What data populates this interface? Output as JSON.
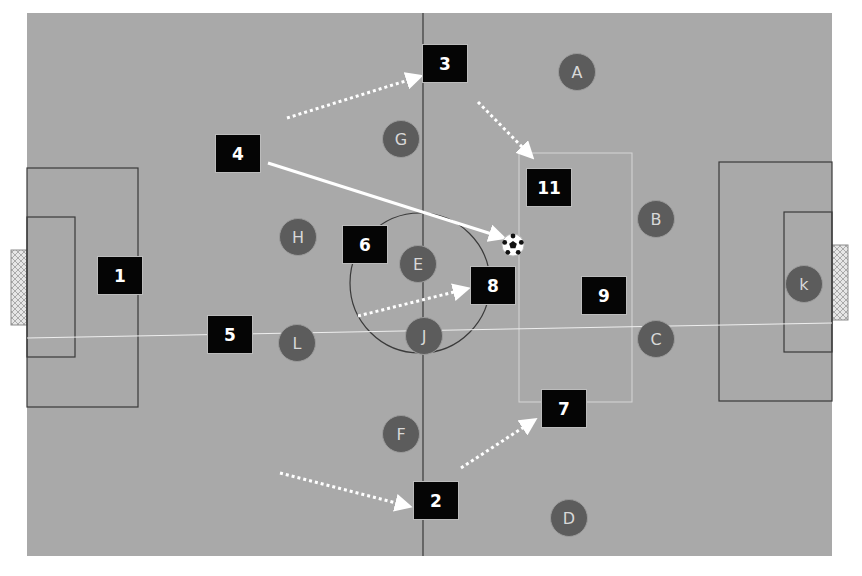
{
  "diagram": {
    "type": "football-tactics-board",
    "colors": {
      "page_background": "#ffffff",
      "pitch": "#a9a9a9",
      "pitch_lines": "#3a3a3a",
      "team_box": "#050505",
      "team_text": "#ffffff",
      "opponent_circle": "#5c5c5c",
      "opponent_text": "#d8d8d8",
      "arrow": "#ffffff"
    },
    "team_players": [
      {
        "label": "1",
        "x": 97,
        "y": 256
      },
      {
        "label": "2",
        "x": 413,
        "y": 481
      },
      {
        "label": "3",
        "x": 422,
        "y": 44
      },
      {
        "label": "4",
        "x": 215,
        "y": 134
      },
      {
        "label": "5",
        "x": 207,
        "y": 315
      },
      {
        "label": "6",
        "x": 342,
        "y": 225
      },
      {
        "label": "7",
        "x": 541,
        "y": 389
      },
      {
        "label": "8",
        "x": 470,
        "y": 266
      },
      {
        "label": "9",
        "x": 581,
        "y": 276
      },
      {
        "label": "11",
        "x": 526,
        "y": 168
      }
    ],
    "opponents": [
      {
        "label": "A",
        "x": 558,
        "y": 53
      },
      {
        "label": "B",
        "x": 637,
        "y": 200
      },
      {
        "label": "C",
        "x": 637,
        "y": 320
      },
      {
        "label": "D",
        "x": 550,
        "y": 499
      },
      {
        "label": "E",
        "x": 399,
        "y": 245
      },
      {
        "label": "F",
        "x": 382,
        "y": 415
      },
      {
        "label": "G",
        "x": 382,
        "y": 120
      },
      {
        "label": "H",
        "x": 279,
        "y": 218
      },
      {
        "label": "J",
        "x": 405,
        "y": 317
      },
      {
        "label": "L",
        "x": 278,
        "y": 324
      },
      {
        "label": "k",
        "x": 785,
        "y": 265
      }
    ],
    "ball": {
      "name": "soccer-ball",
      "x": 513,
      "y": 245
    },
    "movements": [
      {
        "type": "dotted-run",
        "from": [
          287,
          118
        ],
        "to": [
          415,
          78
        ]
      },
      {
        "type": "dotted-run",
        "from": [
          478,
          102
        ],
        "to": [
          528,
          153
        ]
      },
      {
        "type": "solid-pass",
        "from": [
          268,
          163
        ],
        "to": [
          498,
          236
        ]
      },
      {
        "type": "dotted-run",
        "from": [
          358,
          316
        ],
        "to": [
          462,
          290
        ]
      },
      {
        "type": "dotted-run",
        "from": [
          280,
          473
        ],
        "to": [
          404,
          505
        ]
      },
      {
        "type": "dotted-run",
        "from": [
          461,
          468
        ],
        "to": [
          530,
          423
        ]
      }
    ]
  }
}
